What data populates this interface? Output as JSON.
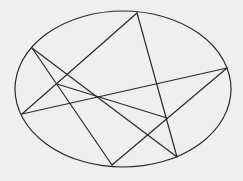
{
  "diagram": {
    "background": "#efefef",
    "stroke_color": "#2a2a2a",
    "stroke_width": 1.2,
    "ellipse": {
      "cx": 123,
      "cy": 89,
      "rx": 108,
      "ry": 78
    },
    "points": {
      "A": [
        137,
        13
      ],
      "B": [
        32,
        48
      ],
      "C": [
        227,
        68
      ],
      "D": [
        22,
        114
      ],
      "E": [
        112,
        165
      ],
      "F": [
        177,
        157
      ],
      "G": [
        57,
        84
      ],
      "H": [
        167,
        118
      ]
    },
    "segments": [
      [
        "A",
        "D"
      ],
      [
        "A",
        "F"
      ],
      [
        "B",
        "E"
      ],
      [
        "B",
        "F"
      ],
      [
        "C",
        "D"
      ],
      [
        "C",
        "E"
      ],
      [
        "G",
        "H"
      ]
    ]
  }
}
